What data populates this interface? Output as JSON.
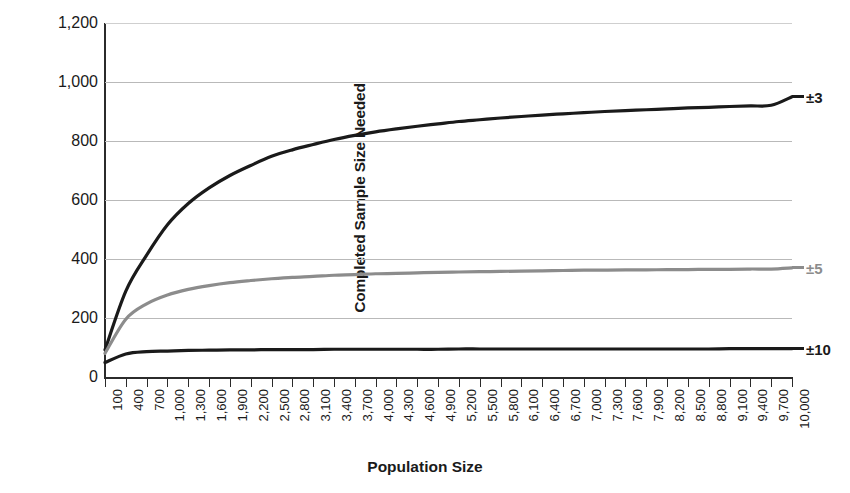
{
  "chart_data": {
    "type": "line",
    "title": "",
    "xlabel": "Population Size",
    "ylabel": "Completed Sample Size Needed",
    "xlim": [
      100,
      10000
    ],
    "ylim": [
      0,
      1200
    ],
    "grid": true,
    "legend_position": "right-of-plot",
    "y_ticks": [
      "0",
      "200",
      "400",
      "600",
      "800",
      "1,000",
      "1,200"
    ],
    "y_tick_values": [
      0,
      200,
      400,
      600,
      800,
      1000,
      1200
    ],
    "x_ticks": [
      "100",
      "400",
      "700",
      "1,000",
      "1,300",
      "1,600",
      "1,900",
      "2,200",
      "2,500",
      "2,800",
      "3,100",
      "3,400",
      "3,700",
      "4,000",
      "4,300",
      "4,600",
      "4,900",
      "5,200",
      "5,500",
      "5,800",
      "6,100",
      "6,400",
      "6,700",
      "7,000",
      "7,300",
      "7,600",
      "7,900",
      "8,200",
      "8,500",
      "8,800",
      "9,100",
      "9,400",
      "9,700",
      "10,000"
    ],
    "x_tick_values": [
      100,
      400,
      700,
      1000,
      1300,
      1600,
      1900,
      2200,
      2500,
      2800,
      3100,
      3400,
      3700,
      4000,
      4300,
      4600,
      4900,
      5200,
      5500,
      5800,
      6100,
      6400,
      6700,
      7000,
      7300,
      7600,
      7900,
      8200,
      8500,
      8800,
      9100,
      9400,
      9700,
      10000
    ],
    "series": [
      {
        "name": "±3",
        "label": "±3",
        "color": "#1a1a1a",
        "margin_of_error_pct": 3,
        "values": [
          {
            "x": 100,
            "y": 92
          },
          {
            "x": 400,
            "y": 291
          },
          {
            "x": 700,
            "y": 413
          },
          {
            "x": 1000,
            "y": 516
          },
          {
            "x": 1300,
            "y": 588
          },
          {
            "x": 1600,
            "y": 641
          },
          {
            "x": 1900,
            "y": 683
          },
          {
            "x": 2200,
            "y": 717
          },
          {
            "x": 2500,
            "y": 748
          },
          {
            "x": 2800,
            "y": 770
          },
          {
            "x": 3100,
            "y": 788
          },
          {
            "x": 3400,
            "y": 805
          },
          {
            "x": 3700,
            "y": 819
          },
          {
            "x": 4000,
            "y": 831
          },
          {
            "x": 4300,
            "y": 841
          },
          {
            "x": 4600,
            "y": 850
          },
          {
            "x": 4900,
            "y": 858
          },
          {
            "x": 5200,
            "y": 866
          },
          {
            "x": 5500,
            "y": 872
          },
          {
            "x": 5800,
            "y": 878
          },
          {
            "x": 6100,
            "y": 883
          },
          {
            "x": 6400,
            "y": 888
          },
          {
            "x": 6700,
            "y": 892
          },
          {
            "x": 7000,
            "y": 896
          },
          {
            "x": 7300,
            "y": 900
          },
          {
            "x": 7600,
            "y": 903
          },
          {
            "x": 7900,
            "y": 906
          },
          {
            "x": 8200,
            "y": 909
          },
          {
            "x": 8500,
            "y": 912
          },
          {
            "x": 8800,
            "y": 914
          },
          {
            "x": 9100,
            "y": 917
          },
          {
            "x": 9400,
            "y": 919
          },
          {
            "x": 9700,
            "y": 921
          },
          {
            "x": 10000,
            "y": 950
          }
        ]
      },
      {
        "name": "±5",
        "label": "±5",
        "color": "#8c8c8c",
        "margin_of_error_pct": 5,
        "values": [
          {
            "x": 100,
            "y": 80
          },
          {
            "x": 400,
            "y": 196
          },
          {
            "x": 700,
            "y": 248
          },
          {
            "x": 1000,
            "y": 278
          },
          {
            "x": 1300,
            "y": 297
          },
          {
            "x": 1600,
            "y": 310
          },
          {
            "x": 1900,
            "y": 320
          },
          {
            "x": 2200,
            "y": 327
          },
          {
            "x": 2500,
            "y": 333
          },
          {
            "x": 2800,
            "y": 338
          },
          {
            "x": 3100,
            "y": 341
          },
          {
            "x": 3400,
            "y": 345
          },
          {
            "x": 3700,
            "y": 347
          },
          {
            "x": 4000,
            "y": 350
          },
          {
            "x": 4300,
            "y": 351
          },
          {
            "x": 4600,
            "y": 353
          },
          {
            "x": 4900,
            "y": 355
          },
          {
            "x": 5200,
            "y": 356
          },
          {
            "x": 5500,
            "y": 357
          },
          {
            "x": 5800,
            "y": 358
          },
          {
            "x": 6100,
            "y": 359
          },
          {
            "x": 6400,
            "y": 360
          },
          {
            "x": 6700,
            "y": 361
          },
          {
            "x": 7000,
            "y": 362
          },
          {
            "x": 7300,
            "y": 362
          },
          {
            "x": 7600,
            "y": 363
          },
          {
            "x": 7900,
            "y": 363
          },
          {
            "x": 8200,
            "y": 364
          },
          {
            "x": 8500,
            "y": 364
          },
          {
            "x": 8800,
            "y": 365
          },
          {
            "x": 9100,
            "y": 365
          },
          {
            "x": 9400,
            "y": 366
          },
          {
            "x": 9700,
            "y": 366
          },
          {
            "x": 10000,
            "y": 370
          }
        ]
      },
      {
        "name": "±10",
        "label": "±10",
        "color": "#1a1a1a",
        "margin_of_error_pct": 10,
        "values": [
          {
            "x": 100,
            "y": 49
          },
          {
            "x": 400,
            "y": 78
          },
          {
            "x": 700,
            "y": 86
          },
          {
            "x": 1000,
            "y": 88
          },
          {
            "x": 1300,
            "y": 90
          },
          {
            "x": 1600,
            "y": 91
          },
          {
            "x": 1900,
            "y": 92
          },
          {
            "x": 2200,
            "y": 92
          },
          {
            "x": 2500,
            "y": 93
          },
          {
            "x": 2800,
            "y": 93
          },
          {
            "x": 3100,
            "y": 93
          },
          {
            "x": 3400,
            "y": 94
          },
          {
            "x": 3700,
            "y": 94
          },
          {
            "x": 4000,
            "y": 94
          },
          {
            "x": 4300,
            "y": 94
          },
          {
            "x": 4600,
            "y": 94
          },
          {
            "x": 4900,
            "y": 94
          },
          {
            "x": 5200,
            "y": 95
          },
          {
            "x": 5500,
            "y": 95
          },
          {
            "x": 5800,
            "y": 95
          },
          {
            "x": 6100,
            "y": 95
          },
          {
            "x": 6400,
            "y": 95
          },
          {
            "x": 6700,
            "y": 95
          },
          {
            "x": 7000,
            "y": 95
          },
          {
            "x": 7300,
            "y": 95
          },
          {
            "x": 7600,
            "y": 95
          },
          {
            "x": 7900,
            "y": 95
          },
          {
            "x": 8200,
            "y": 95
          },
          {
            "x": 8500,
            "y": 95
          },
          {
            "x": 8800,
            "y": 95
          },
          {
            "x": 9100,
            "y": 96
          },
          {
            "x": 9400,
            "y": 96
          },
          {
            "x": 9700,
            "y": 96
          },
          {
            "x": 10000,
            "y": 96
          }
        ]
      }
    ]
  }
}
